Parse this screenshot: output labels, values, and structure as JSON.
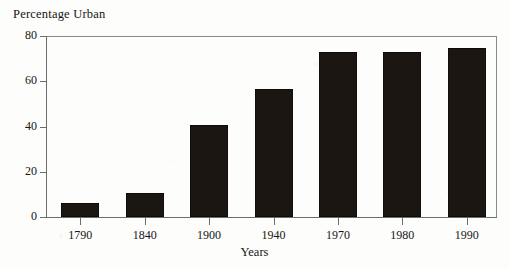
{
  "chart_data": {
    "type": "bar",
    "title": "Percentage Urban",
    "xlabel": "Years",
    "ylabel": "",
    "categories": [
      "1790",
      "1840",
      "1900",
      "1940",
      "1970",
      "1980",
      "1990"
    ],
    "values": [
      6,
      10.5,
      40.5,
      56.5,
      73,
      73,
      74.5
    ],
    "ylim": [
      0,
      80
    ],
    "yticks": [
      "0",
      "20",
      "40",
      "60",
      "80"
    ],
    "ytick_values": [
      0,
      20,
      40,
      60,
      80
    ],
    "grid": false,
    "legend": null,
    "series": [
      {
        "name": "Percentage Urban",
        "values": [
          6,
          10.5,
          40.5,
          56.5,
          73,
          73,
          74.5
        ]
      }
    ],
    "bar_color": "#1c1613",
    "axis_color": "#6d6d6d",
    "background_color": "#fdfdfb"
  }
}
